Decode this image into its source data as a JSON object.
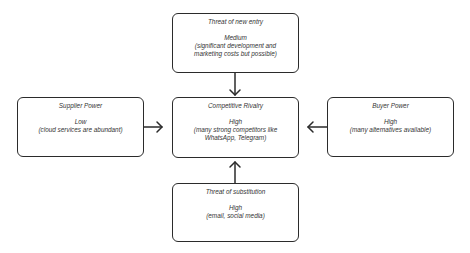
{
  "diagram": {
    "nodes": {
      "new_entry": {
        "title": "Threat of new entry",
        "level": "Medium",
        "detail": "(significant development and marketing costs but possible)"
      },
      "supplier": {
        "title": "Supplier Power",
        "level": "Low",
        "detail": "(cloud services are abundant)"
      },
      "rivalry": {
        "title": "Competitive Rivalry",
        "level": "High",
        "detail": "(many strong competitors like WhatsApp, Telegram)"
      },
      "buyer": {
        "title": "Buyer Power",
        "level": "High",
        "detail": "(many alternatives available)"
      },
      "substitution": {
        "title": "Threat of substitution",
        "level": "High",
        "detail": "(email, social media)"
      }
    },
    "edges": [
      {
        "from": "new_entry",
        "to": "rivalry"
      },
      {
        "from": "supplier",
        "to": "rivalry"
      },
      {
        "from": "buyer",
        "to": "rivalry"
      },
      {
        "from": "substitution",
        "to": "rivalry"
      }
    ],
    "colors": {
      "border": "#2b2b2b",
      "text": "#333333",
      "background": "#ffffff"
    }
  }
}
